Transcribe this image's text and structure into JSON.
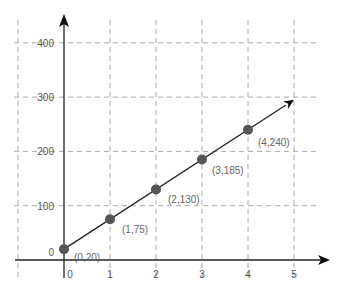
{
  "chart_data": {
    "type": "line",
    "title": "",
    "xlabel": "",
    "ylabel": "",
    "x": [
      0,
      1,
      2,
      3,
      4
    ],
    "series": [
      {
        "name": "line",
        "values": [
          20,
          75,
          130,
          185,
          240
        ]
      }
    ],
    "point_labels": [
      "(0,20)",
      "(1,75)",
      "(2,130)",
      "(3,185)",
      "(4,240)"
    ],
    "x_ticks": [
      "0",
      "1",
      "2",
      "3",
      "4",
      "5"
    ],
    "y_ticks": [
      "0",
      "100",
      "200",
      "300",
      "400"
    ],
    "xlim": [
      -1,
      5.5
    ],
    "ylim": [
      0,
      430
    ],
    "grid": true,
    "line_extends_to": [
      5,
      295
    ],
    "colors": {
      "line": "#222222",
      "points": "#555555",
      "grid": "#aaaaaa"
    }
  }
}
